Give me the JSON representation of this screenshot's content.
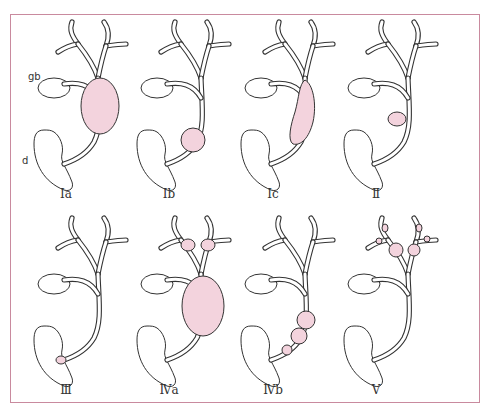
{
  "figure": {
    "frame_color": "#c98a9e",
    "cyst_fill": "#f3d3dd",
    "outline_color": "#333333",
    "anatomy_labels": {
      "gallbladder": "gb",
      "duodenum": "d"
    },
    "panels": [
      {
        "id": "Ia",
        "label": "Ia",
        "row": 0,
        "col": 0,
        "cyst": "fusiform-large"
      },
      {
        "id": "Ib",
        "label": "Ib",
        "row": 0,
        "col": 1,
        "cyst": "focal-distal"
      },
      {
        "id": "Ic",
        "label": "Ic",
        "row": 0,
        "col": 2,
        "cyst": "fusiform-long"
      },
      {
        "id": "II",
        "label": "Ⅱ",
        "row": 0,
        "col": 3,
        "cyst": "diverticulum"
      },
      {
        "id": "III",
        "label": "Ⅲ",
        "row": 1,
        "col": 0,
        "cyst": "choledochocele"
      },
      {
        "id": "IVa",
        "label": "Ⅳa",
        "row": 1,
        "col": 1,
        "cyst": "intra-extrahepatic"
      },
      {
        "id": "IVb",
        "label": "Ⅳb",
        "row": 1,
        "col": 2,
        "cyst": "multiple-extrahepatic"
      },
      {
        "id": "V",
        "label": "Ⅴ",
        "row": 1,
        "col": 3,
        "cyst": "intrahepatic-caroli"
      }
    ]
  }
}
